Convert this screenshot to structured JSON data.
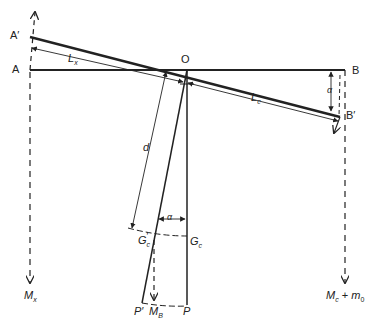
{
  "diagram": {
    "type": "balance beam / pivot mechanics diagram",
    "labels": {
      "A_prime": "A′",
      "A": "A",
      "O": "O",
      "B": "B",
      "B_prime": "B′",
      "Lx": "L",
      "Lx_sub": "x",
      "Lc": "L",
      "Lc_sub": "c",
      "d": "d",
      "alpha_top": "α",
      "alpha_bottom": "α",
      "Gc_prime": "G",
      "Gc_prime_sub": "c",
      "Gc_prime_mark": "′",
      "Gc": "G",
      "Gc_sub": "c",
      "P_prime": "P′",
      "P": "P",
      "MB": "M",
      "MB_sub": "B",
      "Mx": "M",
      "Mx_sub": "x",
      "Mc": "M",
      "Mc_sub": "c",
      "plus": " + ",
      "m0": "m",
      "m0_sub": "0"
    },
    "colors": {
      "line": "#222222",
      "background": "#ffffff"
    }
  }
}
